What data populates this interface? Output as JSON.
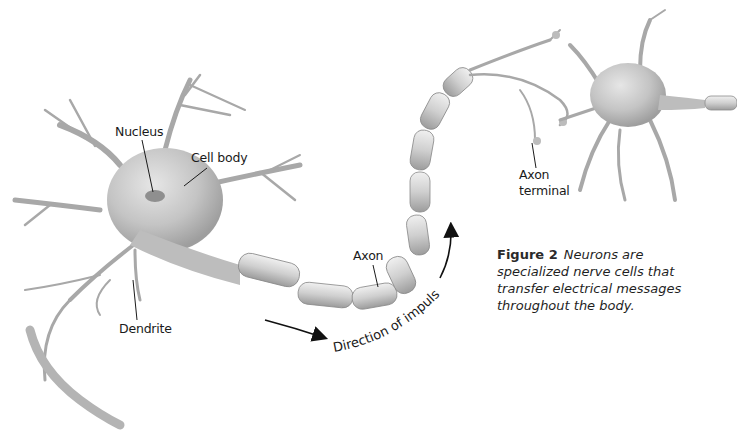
{
  "figure": {
    "number_label": "Figure 2",
    "caption": "Neurons are specialized nerve cells that transfer electrical messages throughout the body.",
    "caption_lines": [
      "Neurons are",
      "specialized nerve cells that",
      "transfer electrical messages",
      "throughout the body."
    ]
  },
  "labels": {
    "nucleus": "Nucleus",
    "cell_body": "Cell body",
    "dendrite": "Dendrite",
    "axon": "Axon",
    "axon_terminal_line1": "Axon",
    "axon_terminal_line2": "terminal",
    "direction": "Direction of impulse"
  },
  "colors": {
    "background": "#ffffff",
    "neuron_fill": "#c9c9c9",
    "neuron_shadow": "#9a9a9a",
    "myelin_fill": "#d6d6d6",
    "text": "#1a1a1a",
    "arrow": "#111111"
  }
}
